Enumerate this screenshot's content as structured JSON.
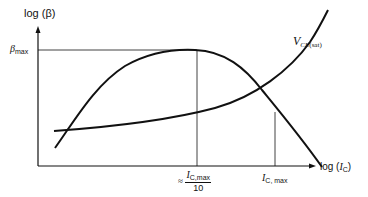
{
  "diagram": {
    "y_axis_label": "log (β)",
    "x_axis_label_prefix": "log (",
    "x_axis_label_var": "I",
    "x_axis_label_sub": "C",
    "x_axis_label_suffix": ")",
    "beta_max_label": "β",
    "beta_max_sub": "max",
    "vce_label_var": "V",
    "vce_label_sub": "CE",
    "vce_label_sub2": "(sat)",
    "tick1_approx": "≈",
    "tick1_num_var": "I",
    "tick1_num_sub": "C,max",
    "tick1_den": "10",
    "tick2_var": "I",
    "tick2_sub": "C, max",
    "curves": [
      "beta-vs-ic",
      "vce-sat-vs-ic"
    ],
    "colors": {
      "line": "#111111",
      "background": "#ffffff"
    }
  }
}
